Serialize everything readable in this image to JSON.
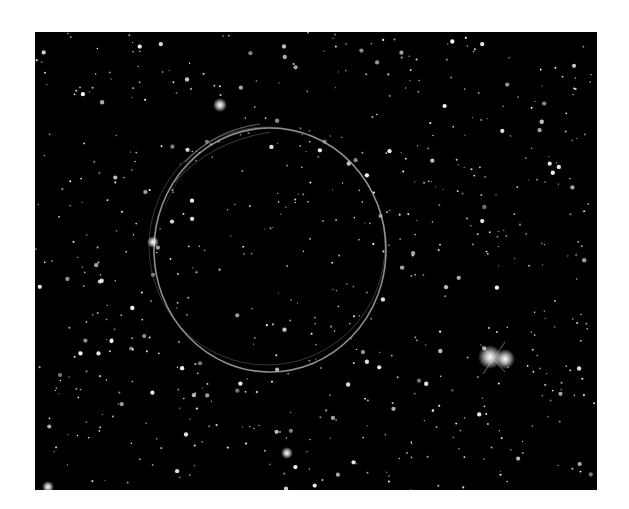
{
  "image": {
    "subject": "supernova-remnant-shell-in-starfield",
    "background_color": "#000000",
    "ring": {
      "cx": 235,
      "cy": 218,
      "rx": 116,
      "ry": 122,
      "color": "#c8c8c8"
    },
    "bright_stars": [
      {
        "x": 455,
        "y": 325,
        "r": 6
      },
      {
        "x": 470,
        "y": 327,
        "r": 5
      },
      {
        "x": 185,
        "y": 73,
        "r": 3.5
      },
      {
        "x": 118,
        "y": 210,
        "r": 3
      },
      {
        "x": 13,
        "y": 455,
        "r": 3
      },
      {
        "x": 252,
        "y": 421,
        "r": 3
      }
    ]
  }
}
